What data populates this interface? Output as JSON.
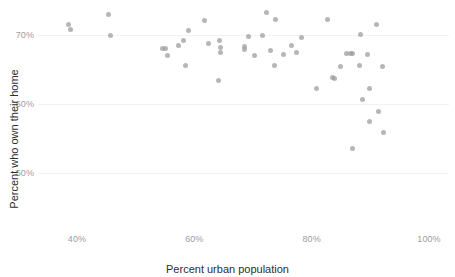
{
  "chart_data": {
    "type": "scatter",
    "title": "",
    "xlabel": "Percent urban population",
    "ylabel": "Percent who own their home",
    "xlim": [
      33,
      102
    ],
    "ylim": [
      32,
      75
    ],
    "grid": false,
    "legend": "none",
    "marker": {
      "color": "#9a9a9a",
      "opacity": 0.72,
      "size_px": 5,
      "shape": "circle"
    },
    "xticks": [
      {
        "value": 40,
        "label": "40%"
      },
      {
        "value": 60,
        "label": "60%"
      },
      {
        "value": 80,
        "label": "80%"
      },
      {
        "value": 100,
        "label": "100%"
      }
    ],
    "yticks": [
      {
        "value": 50,
        "label": "50%"
      },
      {
        "value": 60,
        "label": "60%"
      },
      {
        "value": 70,
        "label": "70%"
      }
    ],
    "points": [
      {
        "x": 38.6,
        "y": 71.5
      },
      {
        "x": 38.9,
        "y": 70.8
      },
      {
        "x": 45.4,
        "y": 73.0
      },
      {
        "x": 45.7,
        "y": 69.9
      },
      {
        "x": 54.6,
        "y": 68.0
      },
      {
        "x": 55.1,
        "y": 68.1
      },
      {
        "x": 55.4,
        "y": 67.1
      },
      {
        "x": 57.3,
        "y": 68.5
      },
      {
        "x": 58.2,
        "y": 69.2
      },
      {
        "x": 59.0,
        "y": 70.7
      },
      {
        "x": 58.5,
        "y": 65.6
      },
      {
        "x": 61.8,
        "y": 72.1
      },
      {
        "x": 62.4,
        "y": 68.8
      },
      {
        "x": 64.3,
        "y": 69.2
      },
      {
        "x": 64.4,
        "y": 68.2
      },
      {
        "x": 64.4,
        "y": 67.5
      },
      {
        "x": 64.2,
        "y": 63.4
      },
      {
        "x": 68.5,
        "y": 68.4
      },
      {
        "x": 68.6,
        "y": 67.9
      },
      {
        "x": 69.2,
        "y": 69.8
      },
      {
        "x": 70.3,
        "y": 67.1
      },
      {
        "x": 71.6,
        "y": 69.9
      },
      {
        "x": 72.3,
        "y": 73.2
      },
      {
        "x": 73.0,
        "y": 67.8
      },
      {
        "x": 73.8,
        "y": 72.3
      },
      {
        "x": 73.6,
        "y": 65.6
      },
      {
        "x": 75.2,
        "y": 67.2
      },
      {
        "x": 76.6,
        "y": 68.5
      },
      {
        "x": 77.4,
        "y": 67.5
      },
      {
        "x": 78.2,
        "y": 69.6
      },
      {
        "x": 80.8,
        "y": 62.3
      },
      {
        "x": 82.7,
        "y": 72.2
      },
      {
        "x": 83.6,
        "y": 63.9
      },
      {
        "x": 83.9,
        "y": 63.7
      },
      {
        "x": 84.9,
        "y": 65.5
      },
      {
        "x": 86.0,
        "y": 67.3
      },
      {
        "x": 86.6,
        "y": 67.3
      },
      {
        "x": 87.0,
        "y": 67.3
      },
      {
        "x": 87.0,
        "y": 53.5
      },
      {
        "x": 88.4,
        "y": 70.1
      },
      {
        "x": 88.1,
        "y": 65.6
      },
      {
        "x": 88.6,
        "y": 60.6
      },
      {
        "x": 89.5,
        "y": 67.2
      },
      {
        "x": 89.8,
        "y": 62.2
      },
      {
        "x": 89.9,
        "y": 57.5
      },
      {
        "x": 91.0,
        "y": 71.5
      },
      {
        "x": 91.4,
        "y": 58.9
      },
      {
        "x": 92.0,
        "y": 65.5
      },
      {
        "x": 92.3,
        "y": 55.9
      },
      {
        "x": 99.6,
        "y": 34.1
      }
    ]
  }
}
